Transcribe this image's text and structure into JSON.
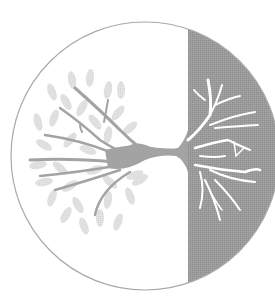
{
  "illustration": {
    "subject": "tree-of-life-emblem",
    "description": "Circle with a sideways tree: leafy canopy on left white half, roots on right gray half",
    "colors": {
      "background": "#ffffff",
      "circle_outline": "#a9a9a9",
      "right_half_fill": "#9b9b9b",
      "trunk_branches": "#a3a3a3",
      "leaves": "#e2e2e2",
      "roots": "#ffffff"
    },
    "circle": {
      "cx": 145,
      "cy": 156,
      "r": 134
    },
    "divider_x": 188
  }
}
